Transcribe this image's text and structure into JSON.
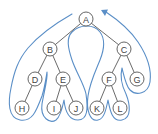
{
  "diagram": {
    "type": "binary-tree-euler-tour",
    "colors": {
      "tour_path": "#5b8fc7",
      "node_stroke": "#555555",
      "edge": "#444444",
      "label": "#444444"
    },
    "nodes": [
      {
        "id": "A",
        "label": "A",
        "x": 86,
        "y": 19
      },
      {
        "id": "B",
        "label": "B",
        "x": 50,
        "y": 49
      },
      {
        "id": "C",
        "label": "C",
        "x": 124,
        "y": 49
      },
      {
        "id": "D",
        "label": "D",
        "x": 35,
        "y": 79
      },
      {
        "id": "E",
        "label": "E",
        "x": 63,
        "y": 79
      },
      {
        "id": "F",
        "label": "F",
        "x": 109,
        "y": 79
      },
      {
        "id": "G",
        "label": "G",
        "x": 137,
        "y": 79
      },
      {
        "id": "H",
        "label": "H",
        "x": 22,
        "y": 108
      },
      {
        "id": "I",
        "label": "I",
        "x": 54,
        "y": 108
      },
      {
        "id": "J",
        "label": "J",
        "x": 76,
        "y": 108
      },
      {
        "id": "K",
        "label": "K",
        "x": 97,
        "y": 108
      },
      {
        "id": "L",
        "label": "L",
        "x": 120,
        "y": 108
      }
    ],
    "edges": [
      [
        "A",
        "B"
      ],
      [
        "A",
        "C"
      ],
      [
        "B",
        "D"
      ],
      [
        "B",
        "E"
      ],
      [
        "C",
        "F"
      ],
      [
        "C",
        "G"
      ],
      [
        "D",
        "H"
      ],
      [
        "E",
        "I"
      ],
      [
        "E",
        "J"
      ],
      [
        "F",
        "K"
      ],
      [
        "F",
        "L"
      ]
    ],
    "arrow": {
      "direction": "toward-A",
      "position": "upper-right"
    }
  }
}
